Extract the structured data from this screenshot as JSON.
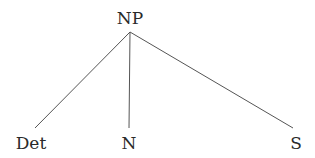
{
  "diagram": {
    "type": "syntax-tree",
    "root": {
      "label": "NP",
      "x": 130,
      "y": 32
    },
    "children": [
      {
        "label": "Det",
        "x": 35,
        "y": 128
      },
      {
        "label": "N",
        "x": 129,
        "y": 128
      },
      {
        "label": "S",
        "x": 293,
        "y": 128
      }
    ],
    "colors": {
      "text": "#2a2a2a",
      "edge": "#555555",
      "background": "#ffffff"
    }
  }
}
